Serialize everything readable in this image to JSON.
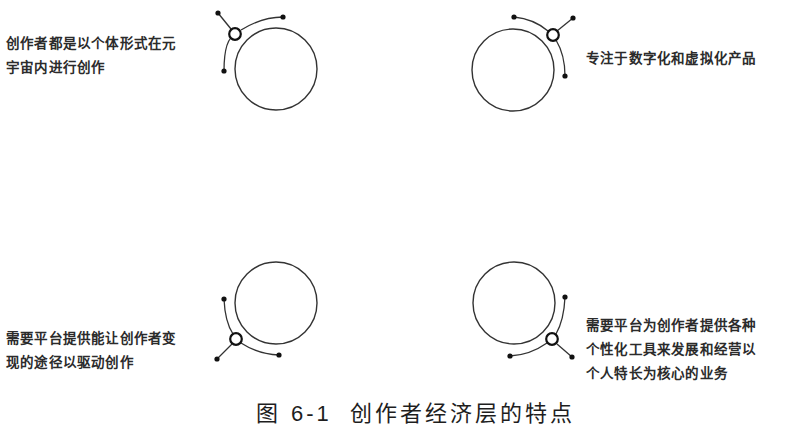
{
  "figure": {
    "caption_prefix": "图",
    "caption_number": "6-1",
    "caption_title": "创作者经济层的特点"
  },
  "features": [
    {
      "position": "top-left",
      "lines": [
        "创作者都是以个体形式在元",
        "宇宙内进行创作"
      ]
    },
    {
      "position": "top-right",
      "lines": [
        "专注于数字化和虚拟化产品"
      ]
    },
    {
      "position": "bottom-left",
      "lines": [
        "需要平台提供能让创作者变",
        "现的途径以驱动创作"
      ]
    },
    {
      "position": "bottom-right",
      "lines": [
        "需要平台为创作者提供各种",
        "个性化工具来发展和经营以",
        "个人特长为核心的业务"
      ]
    }
  ],
  "colors": {
    "stroke": "#333333",
    "text": "#2b2b2b",
    "background": "#ffffff"
  }
}
